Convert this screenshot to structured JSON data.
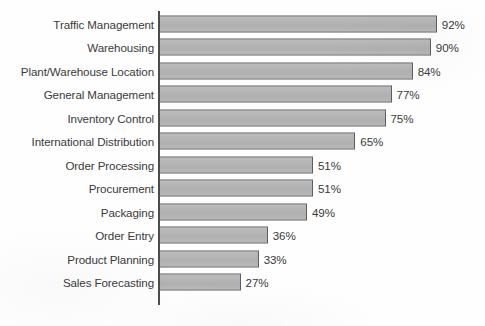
{
  "chart_data": {
    "type": "bar",
    "orientation": "horizontal",
    "title": "",
    "subtitle": "",
    "xlabel": "",
    "ylabel": "",
    "xlim": [
      0,
      100
    ],
    "grid": false,
    "legend": false,
    "legend_position": "none",
    "value_suffix": "%",
    "axis_color": "#4c4c4c",
    "bar_fill_color": "#b5b5b5",
    "bar_border_color": "#5d5d5d",
    "text_color": "#3a3a3a",
    "background_color": "#ffffff",
    "categories": [
      "Traffic Management",
      "Warehousing",
      "Plant/Warehouse Location",
      "General Management",
      "Inventory Control",
      "International Distribution",
      "Order Processing",
      "Procurement",
      "Packaging",
      "Order Entry",
      "Product Planning",
      "Sales Forecasting"
    ],
    "values": [
      92,
      90,
      84,
      77,
      75,
      65,
      51,
      51,
      49,
      36,
      33,
      27
    ],
    "value_labels": [
      "92%",
      "90%",
      "84%",
      "77%",
      "75%",
      "65%",
      "51%",
      "51%",
      "49%",
      "36%",
      "33%",
      "27%"
    ]
  }
}
